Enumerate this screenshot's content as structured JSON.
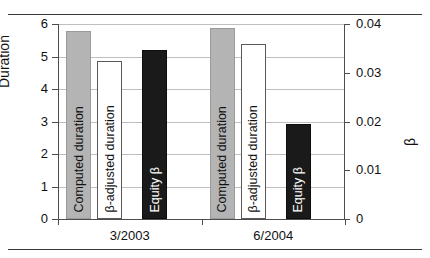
{
  "figure": {
    "title": "",
    "rules": [
      "top-rule",
      "bottom-rule"
    ]
  },
  "axes": {
    "left": {
      "label": "Duration",
      "ticks": [
        "0",
        "1",
        "2",
        "3",
        "4",
        "5",
        "6"
      ],
      "min": 0,
      "max": 6
    },
    "right": {
      "label": "β",
      "ticks": [
        "0",
        "0.01",
        "0.02",
        "0.03",
        "0.04"
      ],
      "min": 0,
      "max": 0.04
    },
    "x": {
      "categories": [
        "3/2003",
        "6/2004"
      ]
    }
  },
  "series_labels": {
    "computed": "Computed duration",
    "adjusted": "β-adjusted duration",
    "equity": "Equity β"
  },
  "colors": {
    "computed": "#b4b4b4",
    "adjusted": "#ffffff",
    "adjusted_border": "#5a5a5a",
    "equity": "#1a1a1a",
    "grid": "#bfbfbf",
    "axis": "#4d4d4d",
    "rule": "#3a3a3a",
    "text": "#111111"
  },
  "chart_data": {
    "type": "bar",
    "title": "",
    "xlabel": "",
    "ylabel": "Duration",
    "y2label": "β",
    "categories": [
      "3/2003",
      "6/2004"
    ],
    "ylim": [
      0,
      6
    ],
    "y2lim": [
      0,
      0.04
    ],
    "grid": true,
    "legend": "none (labels rotated inside bars)",
    "series": [
      {
        "name": "Computed duration",
        "axis": "left",
        "values": [
          5.77,
          5.88
        ],
        "style": "gray fill"
      },
      {
        "name": "β-adjusted duration",
        "axis": "left",
        "values": [
          4.85,
          5.38
        ],
        "style": "white fill, dark outline"
      },
      {
        "name": "Equity β",
        "axis": "right",
        "values": [
          0.0347,
          0.0195
        ],
        "style": "black fill"
      }
    ]
  }
}
